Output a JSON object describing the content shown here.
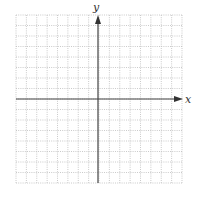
{
  "chart_data": {
    "type": "scatter",
    "title": "",
    "xlabel": "x",
    "ylabel": "y",
    "xlim": [
      -8,
      8
    ],
    "ylim": [
      -8,
      8
    ],
    "grid": true,
    "grid_style": "dotted",
    "grid_divisions": 16,
    "tick_labels": false,
    "series": [],
    "annotations": []
  },
  "axes": {
    "x_label": "x",
    "y_label": "y"
  },
  "colors": {
    "grid": "#bdbdbd",
    "axis": "#444444"
  }
}
